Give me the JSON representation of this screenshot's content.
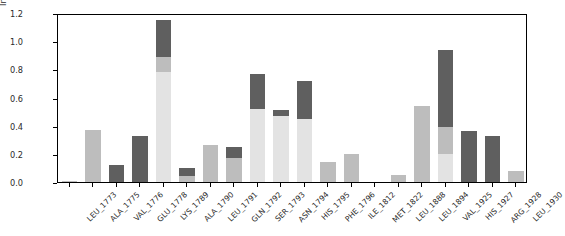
{
  "chart_data": {
    "type": "bar",
    "stacked": true,
    "title": "",
    "xlabel": "",
    "ylabel": "Interactions Fraction",
    "ylim": [
      0.0,
      1.2
    ],
    "yticks": [
      "0.0",
      "0.2",
      "0.4",
      "0.6",
      "0.8",
      "1.0",
      "1.2"
    ],
    "ytick_values": [
      0.0,
      0.2,
      0.4,
      0.6,
      0.8,
      1.0,
      1.2
    ],
    "grid": false,
    "legend": "none",
    "categories": [
      "LEU_1773",
      "ALA_1775",
      "VAL_1776",
      "GLU_1778",
      "LYS_1789",
      "ALA_1790",
      "LEU_1791",
      "GLN_1792",
      "SER_1793",
      "ASN_1794",
      "HIS_1795",
      "PHE_1796",
      "ILE_1812",
      "MET_1822",
      "LEU_1888",
      "LEU_1894",
      "VAL_1925",
      "HIS_1927",
      "ARG_1928",
      "LEU_1930"
    ],
    "series": [
      {
        "name": "light",
        "color": "#e3e3e3",
        "values": [
          0.0,
          0.0,
          0.0,
          0.0,
          0.78,
          0.0,
          0.0,
          0.0,
          0.52,
          0.47,
          0.45,
          0.0,
          0.0,
          0.0,
          0.0,
          0.0,
          0.2,
          0.0,
          0.0,
          0.0
        ]
      },
      {
        "name": "medium",
        "color": "#bdbdbd",
        "values": [
          0.01,
          0.37,
          0.0,
          0.0,
          0.11,
          0.04,
          0.26,
          0.17,
          0.0,
          0.0,
          0.0,
          0.14,
          0.2,
          0.0,
          0.05,
          0.54,
          0.19,
          0.0,
          0.0,
          0.08
        ]
      },
      {
        "name": "dark",
        "color": "#5f5f5f",
        "values": [
          0.0,
          0.0,
          0.12,
          0.33,
          0.26,
          0.06,
          0.0,
          0.08,
          0.25,
          0.04,
          0.27,
          0.0,
          0.0,
          0.0,
          0.0,
          0.0,
          0.55,
          0.36,
          0.33,
          0.0
        ]
      }
    ],
    "totals": [
      0.01,
      0.37,
      0.12,
      0.33,
      1.15,
      0.1,
      0.26,
      0.25,
      0.77,
      0.51,
      0.72,
      0.14,
      0.2,
      0.0,
      0.05,
      0.54,
      0.94,
      0.36,
      0.33,
      0.08
    ]
  }
}
